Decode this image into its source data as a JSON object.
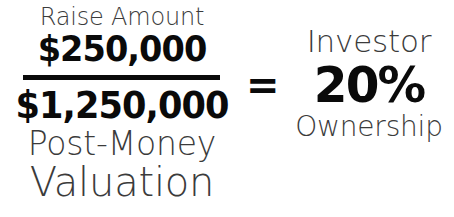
{
  "diagram": {
    "type": "equation-infographic",
    "topic": "Startup equity dilution formula",
    "background_color": "#ffffff",
    "light_text_color": "#3b3b3b",
    "bold_text_color": "#0a0a0a"
  },
  "fraction": {
    "numerator": {
      "label": "Raise Amount",
      "value": "$250,000"
    },
    "bar": {
      "color": "#0a0a0a"
    },
    "denominator": {
      "value": "$1,250,000",
      "label_line1": "Post-Money",
      "label_line2": "Valuation"
    }
  },
  "operator": {
    "symbol": "=",
    "name": "equals-sign"
  },
  "result": {
    "label_top": "Investor",
    "value": "20%",
    "label_bottom": "Ownership"
  }
}
